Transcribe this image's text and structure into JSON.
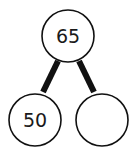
{
  "diagram": {
    "type": "number-bond",
    "whole": {
      "value": "65"
    },
    "parts": [
      {
        "value": "50"
      },
      {
        "value": ""
      }
    ]
  }
}
